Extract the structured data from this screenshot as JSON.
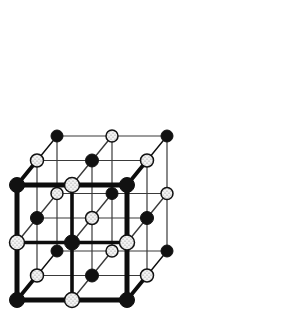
{
  "figure": {
    "width": 300,
    "height": 320,
    "background_color": "#ffffff"
  },
  "geometry": {
    "origin_x": 17,
    "origin_y": 300,
    "step_x": 110,
    "step_y": -115,
    "depth_x": 20,
    "depth_y": -24.5,
    "divisions": 2
  },
  "style": {
    "bond_color": "#111111",
    "front_edge_color": "#0d0d0d",
    "interior_line_color": "#3a3a3a",
    "front_edge_width": 5.0,
    "mid_edge_width": 3.6,
    "interior_line_width": 1.2,
    "depth_bond_width": 1.4,
    "atom_a_fill": "#111111",
    "atom_a_stroke": "#111111",
    "atom_b_fill": "#ffffff",
    "atom_b_stroke": "#111111",
    "atom_b_stipple_color": "#555555",
    "atom_radius_front": 7.5,
    "atom_radius_mid": 6.5,
    "atom_radius_back": 6.0
  },
  "legend": {
    "atom_a_name": "cation-site-sphere",
    "atom_b_name": "anion-site-sphere"
  },
  "lattice": {
    "nodes_label": "lattice node",
    "bonds_label": "lattice bond",
    "planes": [
      {
        "depth": 0,
        "name": "front-plane"
      },
      {
        "depth": 1,
        "name": "middle-plane"
      },
      {
        "depth": 2,
        "name": "back-plane"
      }
    ]
  },
  "chart_data": {
    "type": "scatter",
    "xlabel": "",
    "ylabel": "",
    "grid": true,
    "legend_position": "none",
    "axis_note": "Isometric projection; i = right axis, j = up axis, k = depth axis",
    "series": [
      {
        "name": "Filled spheres (type A)",
        "marker": "filled-circle",
        "color": "#111111",
        "points": [
          [
            0,
            0,
            0
          ],
          [
            2,
            0,
            0
          ],
          [
            0,
            2,
            0
          ],
          [
            2,
            2,
            0
          ],
          [
            1,
            1,
            0
          ],
          [
            1,
            0,
            1
          ],
          [
            0,
            1,
            1
          ],
          [
            2,
            1,
            1
          ],
          [
            1,
            2,
            1
          ],
          [
            0,
            0,
            2
          ],
          [
            2,
            0,
            2
          ],
          [
            0,
            2,
            2
          ],
          [
            2,
            2,
            2
          ],
          [
            1,
            1,
            2
          ]
        ]
      },
      {
        "name": "Stippled spheres (type B)",
        "marker": "stippled-circle",
        "color": "#ffffff",
        "points": [
          [
            1,
            0,
            0
          ],
          [
            0,
            1,
            0
          ],
          [
            2,
            1,
            0
          ],
          [
            1,
            2,
            0
          ],
          [
            0,
            0,
            1
          ],
          [
            2,
            0,
            1
          ],
          [
            1,
            1,
            1
          ],
          [
            0,
            2,
            1
          ],
          [
            2,
            2,
            1
          ],
          [
            1,
            0,
            2
          ],
          [
            0,
            1,
            2
          ],
          [
            2,
            1,
            2
          ],
          [
            1,
            2,
            2
          ]
        ]
      }
    ],
    "xlim": [
      0,
      2
    ],
    "ylim": [
      0,
      2
    ],
    "zlim": [
      0,
      2
    ]
  }
}
